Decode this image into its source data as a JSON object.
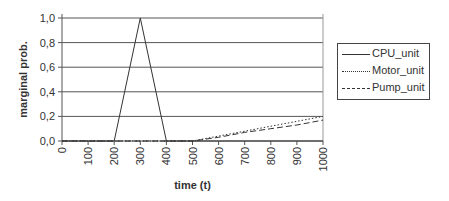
{
  "chart_data": {
    "type": "line",
    "title": "",
    "xlabel": "time (t)",
    "ylabel": "marginal prob.",
    "x_ticks": [
      "0",
      "100",
      "200",
      "300",
      "400",
      "500",
      "600",
      "700",
      "800",
      "900",
      "1000"
    ],
    "y_ticks": [
      "0,0",
      "0,2",
      "0,4",
      "0,6",
      "0,8",
      "1,0"
    ],
    "xlim": [
      0,
      1000
    ],
    "ylim": [
      0,
      1.0
    ],
    "grid": "horizontal",
    "legend_position": "right",
    "x": [
      0,
      100,
      200,
      300,
      400,
      500,
      600,
      700,
      800,
      900,
      1000
    ],
    "series": [
      {
        "name": "CPU_unit",
        "style": "solid",
        "values": [
          0,
          0,
          0,
          1.0,
          0,
          0,
          0,
          0,
          0,
          0,
          0
        ]
      },
      {
        "name": "Motor_unit",
        "style": "dotted",
        "values": [
          0,
          0,
          0,
          0,
          0,
          0,
          0.04,
          0.08,
          0.12,
          0.16,
          0.2
        ]
      },
      {
        "name": "Pump_unit",
        "style": "dashed",
        "values": [
          0,
          0,
          0,
          0,
          0,
          0,
          0.03,
          0.07,
          0.1,
          0.13,
          0.17
        ]
      }
    ]
  },
  "legend": {
    "items": [
      "CPU_unit",
      "Motor_unit",
      "Pump_unit"
    ]
  }
}
